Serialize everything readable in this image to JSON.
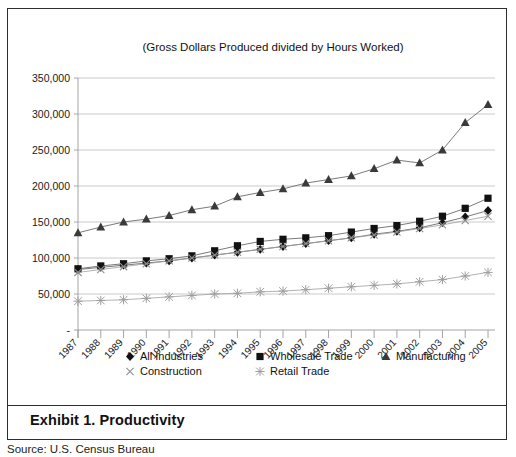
{
  "exhibit": {
    "caption": "Exhibit 1. Productivity",
    "source": "Source: U.S. Census Bureau"
  },
  "chart_data": {
    "type": "line",
    "title": "(Gross Dollars Produced divided by Hours Worked)",
    "xlabel": "",
    "ylabel": "",
    "ylim": [
      0,
      350000
    ],
    "ytick_step": 50000,
    "ytick_labels": [
      "-",
      "50,000",
      "100,000",
      "150,000",
      "200,000",
      "250,000",
      "300,000",
      "350,000"
    ],
    "grid": true,
    "legend_position": "bottom",
    "categories": [
      "1987",
      "1988",
      "1989",
      "1990",
      "1991",
      "1992",
      "1993",
      "1994",
      "1995",
      "1996",
      "1997",
      "1998",
      "1999",
      "2000",
      "2001",
      "2002",
      "2003",
      "2004",
      "2005"
    ],
    "series": [
      {
        "name": "All Industries",
        "marker": "diamond",
        "color": "#111111",
        "values": [
          84000,
          87000,
          90000,
          93000,
          96000,
          100000,
          104000,
          108000,
          112000,
          116000,
          120000,
          124000,
          128000,
          133000,
          137000,
          142000,
          149000,
          157000,
          166000
        ]
      },
      {
        "name": "Wholesale Trade",
        "marker": "square",
        "color": "#111111",
        "values": [
          85000,
          89000,
          92000,
          96000,
          99000,
          103000,
          110000,
          117000,
          123000,
          126000,
          128000,
          131000,
          136000,
          141000,
          145000,
          151000,
          158000,
          169000,
          183000
        ]
      },
      {
        "name": "Manufacturing",
        "marker": "triangle",
        "color": "#3a3a3a",
        "values": [
          135000,
          143000,
          150000,
          154000,
          159000,
          167000,
          172000,
          185000,
          191000,
          196000,
          204000,
          209000,
          214000,
          224000,
          236000,
          232000,
          250000,
          288000,
          313000
        ]
      },
      {
        "name": "Construction",
        "marker": "cross",
        "color": "#8f8f8f",
        "values": [
          80000,
          84000,
          88000,
          92000,
          96000,
          100000,
          104000,
          108000,
          112000,
          116000,
          120000,
          124000,
          128000,
          132000,
          136000,
          141000,
          146000,
          152000,
          158000
        ]
      },
      {
        "name": "Retail Trade",
        "marker": "star",
        "color": "#9e9e9e",
        "values": [
          40000,
          41000,
          42000,
          44000,
          46000,
          48000,
          50000,
          51000,
          53000,
          54000,
          56000,
          58000,
          60000,
          62000,
          64000,
          67000,
          70000,
          75000,
          80000
        ]
      }
    ]
  }
}
